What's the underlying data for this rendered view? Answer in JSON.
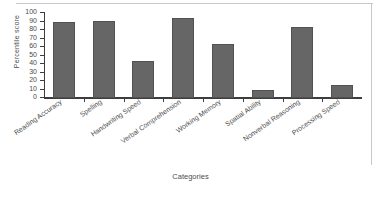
{
  "chart_data": {
    "type": "bar",
    "title": "",
    "xlabel": "Categories",
    "ylabel": "Percentile score",
    "categories": [
      "Reading Accuracy",
      "Spelling",
      "Handwriting Speed",
      "Verbal Comprehension",
      "Working Memory",
      "Spatial Ability",
      "Nonverbal Reasoning",
      "Processing Speed"
    ],
    "values": [
      89,
      91,
      44,
      94,
      63,
      10,
      83,
      15
    ],
    "ylim": [
      0,
      100
    ],
    "ytick_labels": [
      "0",
      "10",
      "20",
      "30",
      "40",
      "50",
      "60",
      "70",
      "80",
      "90",
      "100"
    ],
    "ytick_values": [
      0,
      10,
      20,
      30,
      40,
      50,
      60,
      70,
      80,
      90,
      100
    ],
    "grid": false,
    "legend": false,
    "bar_color": "#666666",
    "bar_edge_color": "#515151",
    "axis_color": "#3d3d3d",
    "text_color": "#4c4c4c",
    "background_color": "#ffffff"
  }
}
